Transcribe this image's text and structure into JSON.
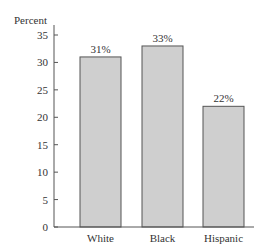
{
  "chart_data": {
    "type": "bar",
    "title": "",
    "xlabel": "",
    "ylabel": "Percent",
    "categories": [
      "White",
      "Black",
      "Hispanic"
    ],
    "values": [
      31,
      33,
      22
    ],
    "data_labels": [
      "31%",
      "33%",
      "22%"
    ],
    "ylim": [
      0,
      35
    ],
    "yticks": [
      0,
      5,
      10,
      15,
      20,
      25,
      30,
      35
    ],
    "grid": false,
    "legend": null,
    "bar_color": "#cfcfcf",
    "bar_edge_color": "#555555"
  }
}
